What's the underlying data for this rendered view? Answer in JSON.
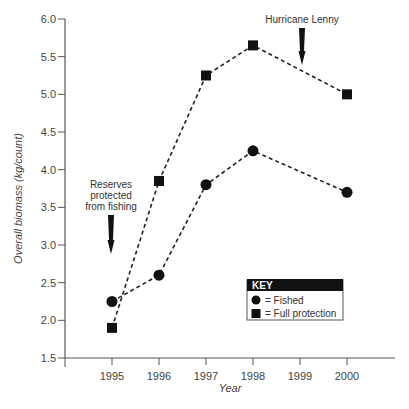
{
  "chart_data": {
    "type": "line",
    "title": "",
    "xlabel": "Year",
    "ylabel": "Overall biomass (kg/count)",
    "x": [
      1995,
      1996,
      1997,
      1998,
      2000
    ],
    "x_ticks": [
      "1995",
      "1996",
      "1997",
      "1998",
      "1999",
      "2000"
    ],
    "y_ticks": [
      "1.5",
      "2.0",
      "2.5",
      "3.0",
      "3.5",
      "4.0",
      "4.5",
      "5.0",
      "5.5",
      "6.0"
    ],
    "ylim": [
      1.5,
      6.0
    ],
    "grid": false,
    "series": [
      {
        "name": "Fished",
        "marker": "circle",
        "values": [
          2.25,
          2.6,
          3.8,
          4.25,
          3.7
        ]
      },
      {
        "name": "Full protection",
        "marker": "square",
        "values": [
          1.9,
          3.85,
          5.25,
          5.65,
          5.0
        ]
      }
    ],
    "legend": {
      "title": "KEY",
      "position": "lower right",
      "entries": [
        "= Fished",
        "= Full protection"
      ]
    },
    "annotations": [
      {
        "text": [
          "Reserves",
          "protected",
          "from fishing"
        ],
        "x": 1995,
        "arrow": "down"
      },
      {
        "text": [
          "Hurricane Lenny"
        ],
        "x": 1999,
        "arrow": "down"
      }
    ]
  }
}
